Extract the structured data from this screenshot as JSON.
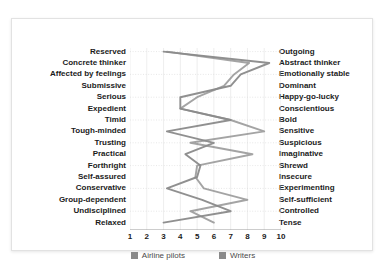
{
  "chart_data": {
    "type": "line",
    "title": "",
    "subtitle": "",
    "xlabel": "",
    "ylabel": "",
    "xlim": [
      1,
      10
    ],
    "xticks": [
      1,
      2,
      3,
      4,
      5,
      6,
      7,
      8,
      9,
      10
    ],
    "grid": true,
    "orientation": "horizontal-traits",
    "legend_position": "bottom",
    "categories_left": [
      "Reserved",
      "Concrete thinker",
      "Affected by feelings",
      "Submissive",
      "Serious",
      "Expedient",
      "Timid",
      "Tough-minded",
      "Trusting",
      "Practical",
      "Forthright",
      "Self-assured",
      "Conservative",
      "Group-dependent",
      "Undisciplined",
      "Relaxed"
    ],
    "categories_right": [
      "Outgoing",
      "Abstract thinker",
      "Emotionally stable",
      "Dominant",
      "Happy-go-lucky",
      "Conscientious",
      "Bold",
      "Sensitive",
      "Suspicious",
      "Imaginative",
      "Shrewd",
      "Insecure",
      "Experimenting",
      "Self-sufficient",
      "Controlled",
      "Tense"
    ],
    "series": [
      {
        "name": "Airline pilots",
        "color": "#8a8a8a",
        "values": [
          3.0,
          9.3,
          7.6,
          7.0,
          4.0,
          4.0,
          7.0,
          3.2,
          6.0,
          4.3,
          5.2,
          5.0,
          3.2,
          5.3,
          7.0,
          3.0
        ]
      },
      {
        "name": "Writers",
        "color": "#8a8a8a",
        "values": [
          3.2,
          8.1,
          7.2,
          6.6,
          5.0,
          4.0,
          7.0,
          9.0,
          4.6,
          8.3,
          5.0,
          4.9,
          5.4,
          8.0,
          4.6,
          6.0
        ]
      }
    ]
  },
  "legend": {
    "items": [
      {
        "label": "Airline pilots",
        "color": "#8a8a8a"
      },
      {
        "label": "Writers",
        "color": "#8a8a8a"
      }
    ]
  },
  "xticks_display": [
    "1",
    "2",
    "3",
    "4",
    "5",
    "6",
    "7",
    "8",
    "9",
    "10"
  ]
}
